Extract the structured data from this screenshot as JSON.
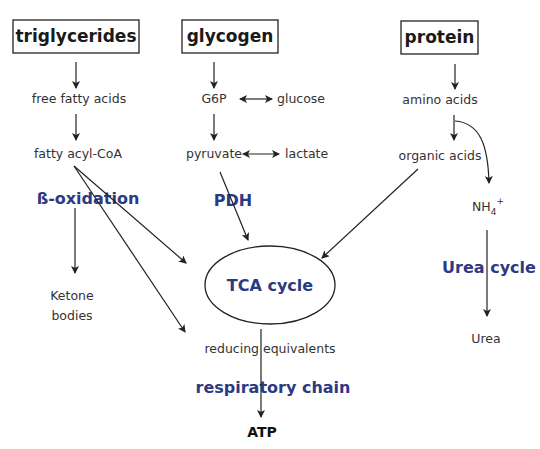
{
  "diagram": {
    "type": "metabolic pathway flowchart",
    "colors": {
      "enzyme_text": "#2c3a82",
      "node_text": "#333333",
      "box_border": "#222222",
      "background": "#ffffff"
    },
    "sources": [
      {
        "id": "triglycerides",
        "label": "triglycerides"
      },
      {
        "id": "glycogen",
        "label": "glycogen"
      },
      {
        "id": "protein",
        "label": "protein"
      }
    ],
    "nodes": {
      "free_fatty_acids": "free fatty acids",
      "fatty_acyl_coa": "fatty acyl-CoA",
      "ketone_bodies_line1": "Ketone",
      "ketone_bodies_line2": "bodies",
      "g6p": "G6P",
      "glucose": "glucose",
      "pyruvate": "pyruvate",
      "lactate": "lactate",
      "amino_acids": "amino acids",
      "organic_acids": "organic acids",
      "nh4": "NH",
      "nh4_sub": "4",
      "nh4_sup": "+",
      "urea": "Urea",
      "tca": "TCA cycle",
      "reducing_equivalents": "reducing equivalents",
      "atp": "ATP"
    },
    "processes": {
      "beta_oxidation": "ß-oxidation",
      "pdh": "PDH",
      "urea_cycle": "Urea cycle",
      "respiratory_chain": "respiratory chain"
    },
    "edges": [
      {
        "from": "triglycerides",
        "to": "free fatty acids"
      },
      {
        "from": "free fatty acids",
        "to": "fatty acyl-CoA"
      },
      {
        "from": "fatty acyl-CoA",
        "to": "Ketone bodies",
        "via": "ß-oxidation"
      },
      {
        "from": "fatty acyl-CoA",
        "to": "TCA cycle"
      },
      {
        "from": "fatty acyl-CoA",
        "to": "reducing equivalents"
      },
      {
        "from": "glycogen",
        "to": "G6P"
      },
      {
        "from": "G6P",
        "to": "glucose",
        "bidirectional": true
      },
      {
        "from": "G6P",
        "to": "pyruvate"
      },
      {
        "from": "pyruvate",
        "to": "lactate",
        "bidirectional": true
      },
      {
        "from": "pyruvate",
        "to": "TCA cycle",
        "via": "PDH"
      },
      {
        "from": "protein",
        "to": "amino acids"
      },
      {
        "from": "amino acids",
        "to": "organic acids"
      },
      {
        "from": "amino acids",
        "to": "NH4+"
      },
      {
        "from": "organic acids",
        "to": "TCA cycle"
      },
      {
        "from": "NH4+",
        "to": "Urea",
        "via": "Urea cycle"
      },
      {
        "from": "TCA cycle",
        "to": "ATP",
        "via": "reducing equivalents, respiratory chain"
      }
    ]
  }
}
